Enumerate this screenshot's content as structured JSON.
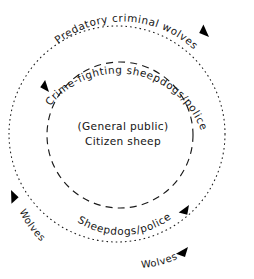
{
  "diagram": {
    "type": "concentric-ring-arrow-diagram",
    "background_color": "#ffffff",
    "line_color": "#1a1a1a",
    "text_color": "#141414",
    "rings": {
      "outer": {
        "name": "outer-dotted-ring",
        "style": "dotted",
        "center_x": 117,
        "center_y": 134,
        "radius": 108,
        "label": "Predatory criminal wolves",
        "secondary_labels": [
          "Wolves",
          "Wolves"
        ],
        "arrow_count": 3,
        "direction": "clockwise"
      },
      "inner": {
        "name": "inner-dashed-ring",
        "style": "dashed",
        "center_x": 120,
        "center_y": 135,
        "radius": 73,
        "label": "Crime-fighting sheepdogs/police",
        "secondary_labels": [
          "Sheepdogs/police"
        ],
        "arrow_count": 2,
        "direction": "clockwise"
      }
    },
    "labels": {
      "outer_top": "Predatory criminal wolves",
      "inner_top": "Crime-fighting sheepdogs/police",
      "inner_bottom": "Sheepdogs/police",
      "outer_left": "Wolves",
      "outer_bottom_right": "Wolves"
    },
    "center": {
      "line1": "(General public)",
      "line2": "Citizen sheep"
    }
  }
}
